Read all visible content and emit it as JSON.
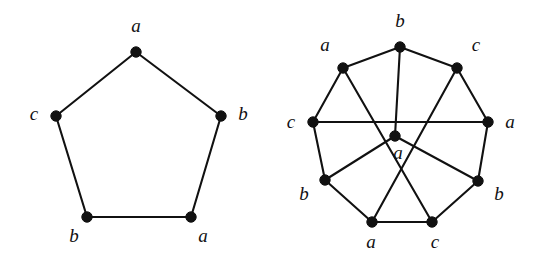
{
  "figure": {
    "caption": "",
    "background_color": "#ffffff",
    "ink_color": "#111111"
  },
  "chart_data": {
    "type": "diagram",
    "title": "",
    "subtitle": "",
    "xlabel": "",
    "ylabel": "",
    "legend": [],
    "annotations": [],
    "graphs": [
      {
        "name": "left-graph",
        "shape": "pentagon-cycle",
        "vertex_count": 5,
        "edge_count": 5,
        "label_alphabet": [
          "a",
          "b",
          "c"
        ],
        "label_sequence_clockwise_from_top": [
          "a",
          "b",
          "a",
          "b",
          "c"
        ],
        "vertices": [
          {
            "id": "L0",
            "label": "a",
            "x": 136,
            "y": 52,
            "label_x": 136,
            "label_y": 28,
            "label_pos": "above"
          },
          {
            "id": "L1",
            "label": "b",
            "x": 221,
            "y": 116,
            "label_x": 243,
            "label_y": 116,
            "label_pos": "right"
          },
          {
            "id": "L2",
            "label": "a",
            "x": 191,
            "y": 217,
            "label_x": 203,
            "label_y": 238,
            "label_pos": "below-right"
          },
          {
            "id": "L3",
            "label": "b",
            "x": 87,
            "y": 217,
            "label_x": 74,
            "label_y": 238,
            "label_pos": "below-left"
          },
          {
            "id": "L4",
            "label": "c",
            "x": 56,
            "y": 116,
            "label_x": 34,
            "label_y": 116,
            "label_pos": "left"
          }
        ],
        "edges": [
          {
            "from": "L0",
            "to": "L1"
          },
          {
            "from": "L1",
            "to": "L2"
          },
          {
            "from": "L2",
            "to": "L3"
          },
          {
            "from": "L3",
            "to": "L4"
          },
          {
            "from": "L4",
            "to": "L0"
          }
        ]
      },
      {
        "name": "right-graph",
        "shape": "octagon-with-center",
        "vertex_count": 9,
        "edge_count": 14,
        "label_alphabet": [
          "a",
          "b",
          "c"
        ],
        "label_sequence_clockwise_from_top": [
          "b",
          "c",
          "a",
          "b",
          "c",
          "a",
          "b",
          "a"
        ],
        "center_label": "a",
        "vertices": [
          {
            "id": "R0",
            "label": "b",
            "x": 130,
            "y": 47,
            "label_x": 130,
            "label_y": 23,
            "label_pos": "above"
          },
          {
            "id": "R1",
            "label": "c",
            "x": 187,
            "y": 68,
            "label_x": 206,
            "label_y": 47,
            "label_pos": "upper-right"
          },
          {
            "id": "R2",
            "label": "a",
            "x": 218,
            "y": 122,
            "label_x": 240,
            "label_y": 124,
            "label_pos": "right"
          },
          {
            "id": "R3",
            "label": "b",
            "x": 208,
            "y": 181,
            "label_x": 229,
            "label_y": 196,
            "label_pos": "lower-right"
          },
          {
            "id": "R4",
            "label": "c",
            "x": 162,
            "y": 222,
            "label_x": 165,
            "label_y": 244,
            "label_pos": "below"
          },
          {
            "id": "R5",
            "label": "a",
            "x": 102,
            "y": 222,
            "label_x": 101,
            "label_y": 244,
            "label_pos": "below"
          },
          {
            "id": "R6",
            "label": "b",
            "x": 55,
            "y": 180,
            "label_x": 34,
            "label_y": 196,
            "label_pos": "lower-left"
          },
          {
            "id": "R7",
            "label": "c",
            "x": 43,
            "y": 122,
            "label_x": 21,
            "label_y": 124,
            "label_pos": "left"
          },
          {
            "id": "R8",
            "label": "a",
            "x": 73,
            "y": 68,
            "label_x": 55,
            "label_y": 47,
            "label_pos": "upper-left"
          },
          {
            "id": "RC",
            "label": "a",
            "x": 125,
            "y": 136,
            "label_x": 128,
            "label_y": 155,
            "label_pos": "below-center"
          }
        ],
        "edges": [
          {
            "from": "R0",
            "to": "R1",
            "kind": "rim"
          },
          {
            "from": "R1",
            "to": "R2",
            "kind": "rim"
          },
          {
            "from": "R2",
            "to": "R3",
            "kind": "rim"
          },
          {
            "from": "R3",
            "to": "R4",
            "kind": "rim"
          },
          {
            "from": "R4",
            "to": "R5",
            "kind": "rim"
          },
          {
            "from": "R5",
            "to": "R6",
            "kind": "rim"
          },
          {
            "from": "R6",
            "to": "R7",
            "kind": "rim"
          },
          {
            "from": "R7",
            "to": "R8",
            "kind": "rim"
          },
          {
            "from": "R8",
            "to": "R0",
            "kind": "rim"
          },
          {
            "from": "R7",
            "to": "R2",
            "kind": "chord-horizontal"
          },
          {
            "from": "R8",
            "to": "R4",
            "kind": "chord-crossing"
          },
          {
            "from": "R1",
            "to": "R5",
            "kind": "chord-crossing"
          },
          {
            "from": "R0",
            "to": "RC",
            "kind": "spoke"
          },
          {
            "from": "RC",
            "to": "R6",
            "kind": "spoke"
          },
          {
            "from": "RC",
            "to": "R3",
            "kind": "spoke"
          }
        ]
      }
    ]
  }
}
